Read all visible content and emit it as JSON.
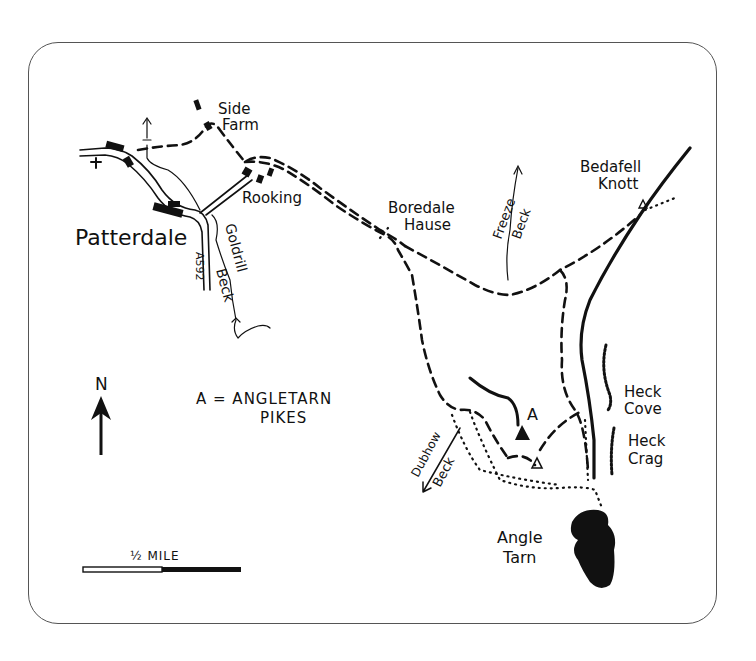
{
  "map": {
    "title_label": "Patterdale",
    "places": {
      "side_farm_1": "Side",
      "side_farm_2": "Farm",
      "rooking": "Rooking",
      "boredale_1": "Boredale",
      "boredale_2": "Hause",
      "bedafell_1": "Bedafell",
      "bedafell_2": "Knott",
      "heck_cove_1": "Heck",
      "heck_cove_2": "Cove",
      "heck_crag_1": "Heck",
      "heck_crag_2": "Crag",
      "angle_tarn_1": "Angle",
      "angle_tarn_2": "Tarn",
      "summit_marker": "A"
    },
    "water": {
      "goldrill": "Goldrill",
      "goldrill_beck": "Beck",
      "freeze": "Freeze",
      "freeze_beck": "Beck",
      "dubhow": "Dubhow",
      "dubhow_beck": "Beck"
    },
    "road": "A592",
    "legend": {
      "line1": "A = ANGLETARN",
      "line2": "PIKES"
    },
    "north": "N",
    "scale": "½ MILE",
    "colors": {
      "ink": "#111111",
      "frame": "#555555",
      "paper": "#ffffff"
    }
  }
}
